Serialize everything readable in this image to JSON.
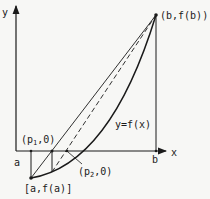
{
  "diagram": {
    "axes": {
      "x_label": "x",
      "y_label": "y"
    },
    "ticks": {
      "a": "a",
      "b": "b"
    },
    "points": {
      "endpoint_b": "(b,f(b))",
      "endpoint_a": "[a,f(a)]",
      "p1_base": "(p",
      "p1_sub": "1",
      "p1_tail": ",0)",
      "p2_base": "(p",
      "p2_sub": "2",
      "p2_tail": ",0)"
    },
    "curve_label": "y=f(x)",
    "colors": {
      "ink": "#1a1a1a",
      "paper": "#f7f7f5"
    }
  }
}
